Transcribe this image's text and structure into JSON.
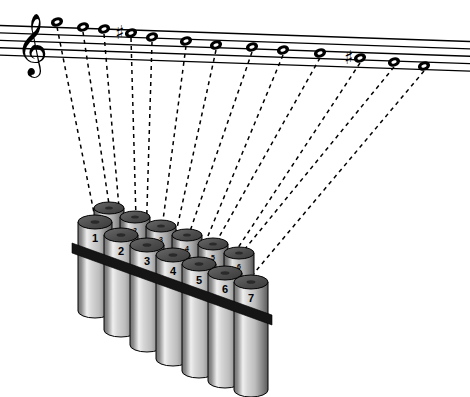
{
  "figure": {
    "background_color": "#ffffff",
    "ink_color": "#000000"
  },
  "staff": {
    "name": "music-staff",
    "line_count": 5,
    "clef": "treble-clef",
    "clef_glyph": "𝄞",
    "tilt_note": "staff rotated slightly clockwise, descending to the right",
    "left_x": 0,
    "right_x": 470,
    "line_color": "#000000"
  },
  "notes": [
    {
      "index": 1,
      "label": "1",
      "x": 57,
      "y": 22,
      "accidental": "",
      "head": "whole-note"
    },
    {
      "index": 2,
      "label": "2",
      "x": 83,
      "y": 27,
      "accidental": "",
      "head": "whole-note"
    },
    {
      "index": 3,
      "label": "3",
      "x": 104,
      "y": 29,
      "accidental": "",
      "head": "whole-note"
    },
    {
      "index": 4,
      "label": "4",
      "x": 131,
      "y": 33,
      "accidental": "sharp",
      "head": "whole-note"
    },
    {
      "index": 5,
      "label": "5",
      "x": 152,
      "y": 37,
      "accidental": "",
      "head": "whole-note"
    },
    {
      "index": 6,
      "label": "6",
      "x": 186,
      "y": 41,
      "accidental": "",
      "head": "whole-note"
    },
    {
      "index": 7,
      "label": "7",
      "x": 216,
      "y": 45,
      "accidental": "",
      "head": "whole-note"
    },
    {
      "index": 8,
      "label": "8",
      "x": 252,
      "y": 47,
      "accidental": "",
      "head": "whole-note"
    },
    {
      "index": 9,
      "label": "9",
      "x": 283,
      "y": 50,
      "accidental": "",
      "head": "whole-note"
    },
    {
      "index": 10,
      "label": "10",
      "x": 320,
      "y": 53,
      "accidental": "",
      "head": "whole-note"
    },
    {
      "index": 11,
      "label": "11",
      "x": 360,
      "y": 58,
      "accidental": "sharp",
      "head": "whole-note"
    },
    {
      "index": 12,
      "label": "12",
      "x": 394,
      "y": 62,
      "accidental": "",
      "head": "whole-note"
    },
    {
      "index": 13,
      "label": "13",
      "x": 424,
      "y": 66,
      "accidental": "",
      "head": "whole-note"
    }
  ],
  "accidentals": {
    "sharp_glyph": "♯",
    "count": 2,
    "positions": [
      "note-4",
      "note-11"
    ]
  },
  "leader_lines": {
    "name": "dashed-leader-lines",
    "count": 13,
    "style": "dashed",
    "dash_pattern": "4,4",
    "color": "#000000",
    "targets": [
      {
        "from_note": 1,
        "to_x": 95,
        "to_y": 218
      },
      {
        "from_note": 2,
        "to_x": 110,
        "to_y": 211
      },
      {
        "from_note": 3,
        "to_x": 121,
        "to_y": 231
      },
      {
        "from_note": 4,
        "to_x": 136,
        "to_y": 219
      },
      {
        "from_note": 5,
        "to_x": 146,
        "to_y": 241
      },
      {
        "from_note": 6,
        "to_x": 162,
        "to_y": 228
      },
      {
        "from_note": 7,
        "to_x": 172,
        "to_y": 251
      },
      {
        "from_note": 8,
        "to_x": 188,
        "to_y": 237
      },
      {
        "from_note": 9,
        "to_x": 198,
        "to_y": 260
      },
      {
        "from_note": 10,
        "to_x": 214,
        "to_y": 246
      },
      {
        "from_note": 11,
        "to_x": 224,
        "to_y": 269
      },
      {
        "from_note": 12,
        "to_x": 240,
        "to_y": 255
      },
      {
        "from_note": 13,
        "to_x": 250,
        "to_y": 278
      }
    ]
  },
  "panpipe": {
    "name": "panpipe-tube-bundle",
    "front_row_label": "front-row-tubes",
    "back_row_label": "back-row-tubes",
    "front_tube_count": 7,
    "back_tube_count": 6,
    "front_tube_numbers": [
      "1",
      "2",
      "3",
      "4",
      "5",
      "6",
      "7"
    ],
    "back_tube_numbers": [
      "1",
      "2",
      "3",
      "4",
      "5",
      "6"
    ],
    "binding_band": {
      "name": "binding-band",
      "color": "#1a1a1a",
      "description": "dark diagonal strap crossing all tubes"
    },
    "tube_colors": {
      "highlight": "#f2f2f2",
      "mid": "#c9c9c9",
      "shade": "#6e6e6e",
      "dark": "#4a4a4a",
      "top_ellipse": "#545454",
      "outline": "#000000"
    },
    "front_tubes": [
      {
        "n": "1",
        "cx": 95,
        "top": 222,
        "bottom": 318,
        "rx": 17,
        "ry": 7
      },
      {
        "n": "2",
        "cx": 121,
        "top": 235,
        "bottom": 337,
        "rx": 17,
        "ry": 7
      },
      {
        "n": "3",
        "cx": 147,
        "top": 245,
        "bottom": 352,
        "rx": 17,
        "ry": 7
      },
      {
        "n": "4",
        "cx": 173,
        "top": 255,
        "bottom": 366,
        "rx": 17,
        "ry": 7
      },
      {
        "n": "5",
        "cx": 199,
        "top": 264,
        "bottom": 378,
        "rx": 17,
        "ry": 7
      },
      {
        "n": "6",
        "cx": 225,
        "top": 273,
        "bottom": 388,
        "rx": 17,
        "ry": 7
      },
      {
        "n": "7",
        "cx": 251,
        "top": 282,
        "bottom": 397,
        "rx": 17,
        "ry": 7
      }
    ],
    "back_tubes": [
      {
        "n": "1",
        "cx": 109,
        "top": 208,
        "bottom": 300,
        "rx": 15,
        "ry": 6
      },
      {
        "n": "2",
        "cx": 135,
        "top": 217,
        "bottom": 315,
        "rx": 15,
        "ry": 6
      },
      {
        "n": "3",
        "cx": 161,
        "top": 226,
        "bottom": 330,
        "rx": 15,
        "ry": 6
      },
      {
        "n": "4",
        "cx": 187,
        "top": 235,
        "bottom": 345,
        "rx": 15,
        "ry": 6
      },
      {
        "n": "5",
        "cx": 213,
        "top": 244,
        "bottom": 358,
        "rx": 15,
        "ry": 6
      },
      {
        "n": "6",
        "cx": 239,
        "top": 253,
        "bottom": 370,
        "rx": 15,
        "ry": 6
      }
    ]
  }
}
